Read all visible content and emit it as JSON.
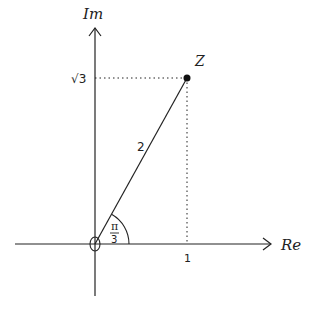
{
  "diagram": {
    "type": "complex-plane",
    "axes": {
      "x_label": "Re",
      "y_label": "Im"
    },
    "point": {
      "label": "Z",
      "re": "1",
      "im": "√3"
    },
    "ticks": {
      "x_tick": "1",
      "y_tick": "√3"
    },
    "modulus_label": "2",
    "angle": {
      "numerator": "π",
      "denominator": "3"
    },
    "colors": {
      "line": "#222222",
      "background": "#ffffff"
    }
  }
}
